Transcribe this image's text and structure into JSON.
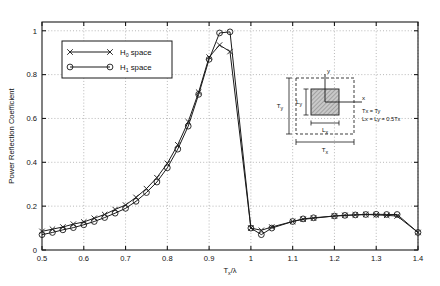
{
  "chart_data": {
    "type": "line",
    "title": "",
    "xlabel": "Tx/λ",
    "xlabel_main": "T",
    "xlabel_sub": "x",
    "xlabel_tail": "/λ",
    "ylabel": "Power Reflection Coefficient",
    "xlim": [
      0.5,
      1.4
    ],
    "ylim": [
      0,
      1.04
    ],
    "xticks": [
      "0.5",
      "0.6",
      "0.7",
      "0.8",
      "0.9",
      "1",
      "1.1",
      "1.2",
      "1.3",
      "1.4"
    ],
    "xtick_values": [
      0.5,
      0.6,
      0.7,
      0.8,
      0.9,
      1.0,
      1.1,
      1.2,
      1.3,
      1.4
    ],
    "yticks": [
      "0",
      "0.2",
      "0.4",
      "0.6",
      "0.8",
      "1"
    ],
    "ytick_values": [
      0,
      0.2,
      0.4,
      0.6,
      0.8,
      1.0
    ],
    "grid": true,
    "grid_style": "dotted",
    "legend_position": "upper-left-inside",
    "series": [
      {
        "name": "H0 space",
        "name_main": "H",
        "name_sub": "0",
        "name_tail": " space",
        "marker": "x",
        "x": [
          0.5,
          0.525,
          0.55,
          0.575,
          0.6,
          0.625,
          0.65,
          0.675,
          0.7,
          0.725,
          0.75,
          0.775,
          0.8,
          0.825,
          0.85,
          0.875,
          0.9,
          0.925,
          0.95,
          1.0,
          1.025,
          1.05,
          1.1,
          1.125,
          1.15,
          1.2,
          1.225,
          1.25,
          1.275,
          1.3,
          1.325,
          1.35,
          1.4
        ],
        "y": [
          0.085,
          0.095,
          0.105,
          0.118,
          0.128,
          0.145,
          0.162,
          0.185,
          0.205,
          0.24,
          0.28,
          0.33,
          0.395,
          0.48,
          0.585,
          0.72,
          0.88,
          0.935,
          0.905,
          0.1,
          0.09,
          0.105,
          0.13,
          0.14,
          0.145,
          0.155,
          0.158,
          0.16,
          0.162,
          0.16,
          0.158,
          0.155,
          0.08
        ]
      },
      {
        "name": "H1 space",
        "name_main": "H",
        "name_sub": "1",
        "name_tail": " space",
        "marker": "o",
        "x": [
          0.5,
          0.525,
          0.55,
          0.575,
          0.6,
          0.625,
          0.65,
          0.675,
          0.7,
          0.725,
          0.75,
          0.775,
          0.8,
          0.825,
          0.85,
          0.875,
          0.9,
          0.925,
          0.95,
          1.0,
          1.025,
          1.05,
          1.1,
          1.125,
          1.15,
          1.2,
          1.225,
          1.25,
          1.275,
          1.3,
          1.325,
          1.35,
          1.4
        ],
        "y": [
          0.07,
          0.08,
          0.092,
          0.102,
          0.115,
          0.13,
          0.148,
          0.168,
          0.19,
          0.222,
          0.262,
          0.31,
          0.375,
          0.46,
          0.565,
          0.71,
          0.87,
          0.99,
          0.995,
          0.1,
          0.07,
          0.1,
          0.13,
          0.142,
          0.147,
          0.155,
          0.158,
          0.16,
          0.162,
          0.163,
          0.162,
          0.162,
          0.08
        ]
      }
    ],
    "annotations": {
      "inset": {
        "y_axis_label": "y",
        "x_axis_label": "x",
        "outer_width_label": "Tx",
        "outer_width_main": "T",
        "outer_width_sub": "x",
        "outer_height_label": "Ty",
        "outer_height_main": "T",
        "outer_height_sub": "y",
        "inner_width_label": "Lx",
        "inner_width_main": "L",
        "inner_width_sub": "x",
        "inner_height_label": "Ly",
        "inner_height_main": "L",
        "inner_height_sub": "y",
        "note_line1": "Tx = Ty",
        "note_line2": "Lx = Ly = 0.5Tx"
      }
    },
    "colors": {
      "line": "#1a1a1a",
      "grid": "#999999",
      "patch_fill": "#b9b9b9",
      "background": "#ffffff"
    }
  }
}
